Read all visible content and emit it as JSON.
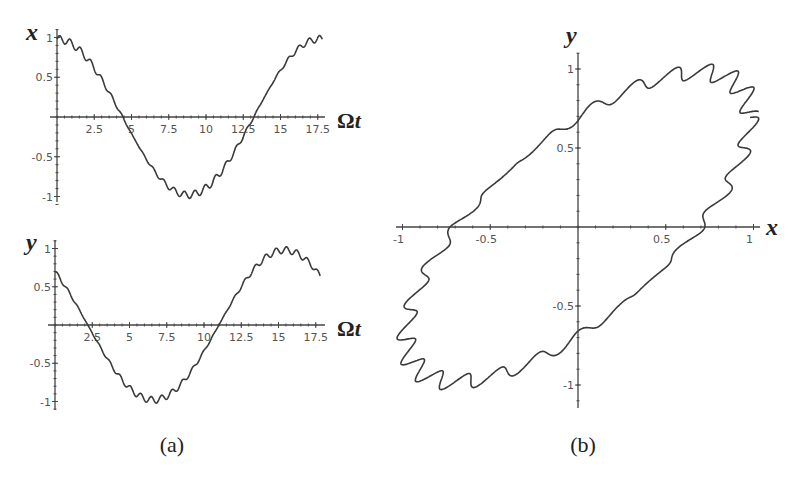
{
  "figure": {
    "panel_labels": [
      "(a)",
      "(b)"
    ]
  },
  "chart_data": [
    {
      "id": "a-top",
      "type": "line",
      "title": "",
      "xlabel": "Ωt",
      "ylabel": "x",
      "xlim": [
        0,
        17.8
      ],
      "ylim": [
        -1.05,
        1.05
      ],
      "x_ticks": [
        2.5,
        5,
        7.5,
        10,
        12.5,
        15,
        17.5
      ],
      "x_tick_labels": [
        "2.5",
        "5",
        "7.5",
        "10",
        "12.5",
        "15",
        "17.5"
      ],
      "y_ticks": [
        -1,
        -0.5,
        0.5,
        1
      ],
      "y_tick_labels": [
        "-1",
        "-0.5",
        "0.5",
        "1"
      ],
      "grid": false,
      "legend": null,
      "description": "x(Ωt) ~ cos(0.357·Ωt) with small fast ripple (amplitude ~0.05); starts at 1, zero crossings near 4.4 and 13.2, minimum ~-1 near 8.8, returns to ~1 at 17.5",
      "series": [
        {
          "name": "x",
          "x": [
            0,
            2.5,
            4.4,
            5,
            7.5,
            8.8,
            10,
            12.5,
            13.2,
            15,
            17.5
          ],
          "values": [
            1.0,
            0.63,
            0.0,
            -0.21,
            -0.9,
            -1.0,
            -0.94,
            -0.22,
            0.0,
            0.6,
            0.98
          ]
        }
      ]
    },
    {
      "id": "a-bottom",
      "type": "line",
      "title": "",
      "xlabel": "Ωt",
      "ylabel": "y",
      "xlim": [
        0,
        17.8
      ],
      "ylim": [
        -1.05,
        1.05
      ],
      "x_ticks": [
        2.5,
        5,
        7.5,
        10,
        12.5,
        15,
        17.5
      ],
      "x_tick_labels": [
        "2.5",
        "5",
        "7.5",
        "10",
        "12.5",
        "15",
        "17.5"
      ],
      "y_ticks": [
        -1,
        -0.5,
        0.5,
        1
      ],
      "y_tick_labels": [
        "-1",
        "-0.5",
        "0.5",
        "1"
      ],
      "grid": false,
      "legend": null,
      "description": "y(Ωt) ~ cos(0.357·Ωt + π/4) with small fast ripple; starts ~0.7, zero crossings near 2.2 and 10.9, minimum ~-1 near 6.6, maximum ~1 near 15.4, ends ~0.65",
      "series": [
        {
          "name": "y",
          "x": [
            0,
            2.2,
            5,
            6.6,
            7.5,
            10,
            10.9,
            12.5,
            15,
            15.4,
            17.5
          ],
          "values": [
            0.7,
            0.0,
            -0.9,
            -1.0,
            -0.97,
            -0.3,
            0.0,
            0.55,
            0.99,
            1.0,
            0.65
          ]
        }
      ]
    },
    {
      "id": "b",
      "type": "line",
      "title": "",
      "xlabel": "x",
      "ylabel": "y",
      "xlim": [
        -1.05,
        1.05
      ],
      "ylim": [
        -1.1,
        1.1
      ],
      "x_ticks": [
        -1,
        -0.5,
        0.5,
        1
      ],
      "x_tick_labels": [
        "-1",
        "-0.5",
        "0.5",
        "1"
      ],
      "y_ticks": [
        -1,
        -0.5,
        0.5,
        1
      ],
      "y_tick_labels": [
        "-1",
        "-0.5",
        "0.5",
        "1"
      ],
      "grid": false,
      "legend": null,
      "description": "Parametric phase-plane trajectory (x vs y): tilted ellipse with fast ripples, crosses y-axis at ~0.75 and ~-0.79, crosses x-axis at ~-0.69 and ~0.69",
      "series": [
        {
          "name": "trajectory",
          "x": [
            0.0,
            0.69,
            1.0,
            0.71,
            0.0,
            -0.69,
            -1.0,
            -0.71,
            0.0
          ],
          "values": [
            0.75,
            1.0,
            0.7,
            0.0,
            -0.79,
            -1.0,
            -0.7,
            0.0,
            0.75
          ]
        }
      ]
    }
  ]
}
